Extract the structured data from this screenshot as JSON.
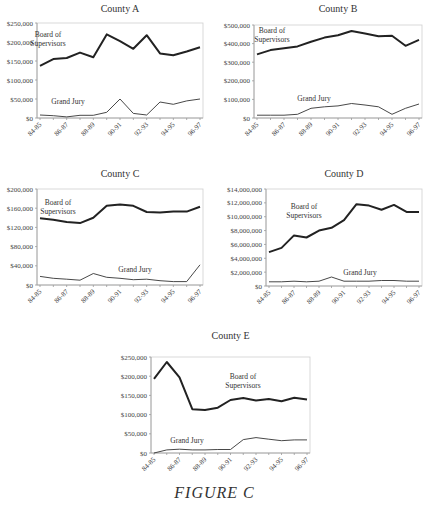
{
  "figure": {
    "caption": "FIGURE C"
  },
  "chart_data": [
    {
      "type": "line",
      "title": "County A",
      "x": [
        "84-85",
        "85-86",
        "86-87",
        "87-88",
        "88-89",
        "89-90",
        "90-91",
        "91-92",
        "92-93",
        "93-94",
        "94-95",
        "95-96",
        "96-97"
      ],
      "x_tick_labels": [
        "84-85",
        "86-87",
        "88-89",
        "90-91",
        "92-93",
        "94-95",
        "96-97"
      ],
      "ylim": [
        0,
        250000
      ],
      "y_ticks": [
        0,
        50000,
        100000,
        150000,
        200000,
        250000
      ],
      "y_tick_labels": [
        "$0",
        "$50,000",
        "$100,000",
        "$150,000",
        "$200,000",
        "$250,000"
      ],
      "series": [
        {
          "name": "Board of Supervisors",
          "values": [
            137000,
            155000,
            158000,
            172000,
            160000,
            220000,
            202000,
            182000,
            218000,
            170000,
            165000,
            175000,
            186000
          ]
        },
        {
          "name": "Grand Jury",
          "values": [
            8000,
            6000,
            3000,
            7000,
            7000,
            15000,
            50000,
            12000,
            8000,
            42000,
            36000,
            45000,
            50000
          ]
        }
      ],
      "annotations": [
        {
          "text": "Board of\nSupervisors",
          "series": "Board of Supervisors"
        },
        {
          "text": "Grand Jury",
          "series": "Grand Jury"
        }
      ],
      "grid": false
    },
    {
      "type": "line",
      "title": "County B",
      "x": [
        "84-85",
        "85-86",
        "86-87",
        "87-88",
        "88-89",
        "89-90",
        "90-91",
        "91-92",
        "92-93",
        "93-94",
        "94-95",
        "95-96",
        "96-97"
      ],
      "x_tick_labels": [
        "84-85",
        "86-87",
        "88-89",
        "90-91",
        "92-93",
        "94-95",
        "96-97"
      ],
      "ylim": [
        0,
        500000
      ],
      "y_ticks": [
        0,
        100000,
        200000,
        300000,
        400000,
        500000
      ],
      "y_tick_labels": [
        "$0",
        "$100,000",
        "$200,000",
        "$300,000",
        "$400,000",
        "$500,000"
      ],
      "series": [
        {
          "name": "Board of Supervisors",
          "values": [
            342000,
            365000,
            375000,
            385000,
            410000,
            432000,
            445000,
            468000,
            455000,
            440000,
            442000,
            388000,
            420000
          ]
        },
        {
          "name": "Grand Jury",
          "values": [
            15000,
            15000,
            15000,
            20000,
            52000,
            60000,
            65000,
            78000,
            70000,
            60000,
            20000,
            52000,
            75000
          ]
        }
      ],
      "annotations": [
        {
          "text": "Board of\nSupervisors",
          "series": "Board of Supervisors"
        },
        {
          "text": "Grand Jury",
          "series": "Grand Jury"
        }
      ],
      "grid": false
    },
    {
      "type": "line",
      "title": "County C",
      "x": [
        "84-85",
        "85-86",
        "86-87",
        "87-88",
        "88-89",
        "89-90",
        "90-91",
        "91-92",
        "92-93",
        "93-94",
        "94-95",
        "95-96",
        "96-97"
      ],
      "x_tick_labels": [
        "84-85",
        "86-87",
        "88-89",
        "90-91",
        "92-93",
        "94-95",
        "96-97"
      ],
      "ylim": [
        0,
        200000
      ],
      "y_ticks": [
        0,
        40000,
        80000,
        120000,
        160000,
        200000
      ],
      "y_tick_labels": [
        "$0",
        "$40,000",
        "$80,000",
        "$120,000",
        "$160,000",
        "$200,000"
      ],
      "series": [
        {
          "name": "Board of Supervisors",
          "values": [
            139000,
            136000,
            131000,
            129000,
            140000,
            165000,
            168000,
            165000,
            152000,
            151000,
            153000,
            153000,
            163000
          ]
        },
        {
          "name": "Grand Jury",
          "values": [
            18000,
            14000,
            12000,
            10000,
            24000,
            16000,
            14000,
            11000,
            12000,
            9000,
            7000,
            7000,
            42000
          ]
        }
      ],
      "annotations": [
        {
          "text": "Board of\nSupervisors",
          "series": "Board of Supervisors"
        },
        {
          "text": "Grand Jury",
          "series": "Grand Jury"
        }
      ],
      "grid": false
    },
    {
      "type": "line",
      "title": "County D",
      "x": [
        "84-85",
        "85-86",
        "86-87",
        "87-88",
        "88-89",
        "89-90",
        "90-91",
        "91-92",
        "92-93",
        "93-94",
        "94-95",
        "95-96",
        "96-97"
      ],
      "x_tick_labels": [
        "84-85",
        "86-87",
        "88-89",
        "90-91",
        "92-93",
        "94-95",
        "96-97"
      ],
      "ylim": [
        0,
        14000000
      ],
      "y_ticks": [
        0,
        2000000,
        4000000,
        6000000,
        8000000,
        10000000,
        12000000,
        14000000
      ],
      "y_tick_labels": [
        "$0",
        "$2,000,000",
        "$4,000,000",
        "$6,000,000",
        "$8,000,000",
        "$10,000,000",
        "$12,000,000",
        "$14,000,000"
      ],
      "series": [
        {
          "name": "Board of Supervisors",
          "values": [
            4900000,
            5500000,
            7300000,
            7000000,
            8000000,
            8400000,
            9500000,
            11800000,
            11600000,
            11000000,
            11700000,
            10700000,
            10700000
          ]
        },
        {
          "name": "Grand Jury",
          "values": [
            600000,
            600000,
            700000,
            600000,
            700000,
            1300000,
            700000,
            700000,
            700000,
            800000,
            800000,
            700000,
            700000
          ]
        }
      ],
      "annotations": [
        {
          "text": "Board of\nSupervisors",
          "series": "Board of Supervisors"
        },
        {
          "text": "Grand Jury",
          "series": "Grand Jury"
        }
      ],
      "grid": false
    },
    {
      "type": "line",
      "title": "County E",
      "x": [
        "84-85",
        "85-86",
        "86-87",
        "87-88",
        "88-89",
        "89-90",
        "90-91",
        "91-92",
        "92-93",
        "93-94",
        "94-95",
        "95-96",
        "96-97"
      ],
      "x_tick_labels": [
        "84-85",
        "86-87",
        "88-89",
        "90-91",
        "92-93",
        "94-95",
        "96-97"
      ],
      "ylim": [
        0,
        250000
      ],
      "y_ticks": [
        0,
        50000,
        100000,
        150000,
        200000,
        250000
      ],
      "y_tick_labels": [
        "$0",
        "$50,000",
        "$100,000",
        "$150,000",
        "$200,000",
        "$250,000"
      ],
      "series": [
        {
          "name": "Board of Supervisors",
          "values": [
            193000,
            237000,
            197000,
            114000,
            112000,
            118000,
            138000,
            143000,
            137000,
            141000,
            135000,
            144000,
            139000
          ]
        },
        {
          "name": "Grand Jury",
          "values": [
            0,
            8000,
            10000,
            8000,
            8000,
            9000,
            9000,
            35000,
            40000,
            36000,
            32000,
            34000,
            34000
          ]
        }
      ],
      "annotations": [
        {
          "text": "Board of\nSupervisors",
          "series": "Board of Supervisors"
        },
        {
          "text": "Grand Jury",
          "series": "Grand Jury"
        }
      ],
      "grid": false
    }
  ]
}
